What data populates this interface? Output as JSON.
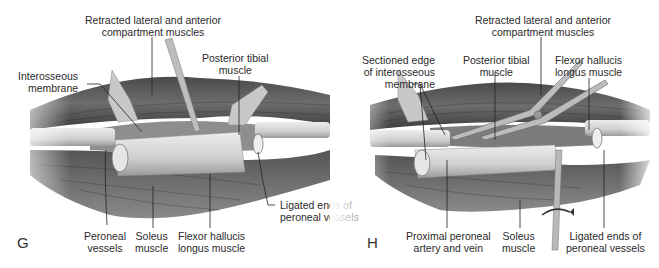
{
  "figure": {
    "panels": [
      {
        "id": "G",
        "letter": "G",
        "labels": {
          "retracted": "Retracted lateral and anterior\ncompartment muscles",
          "interosseous": "Interosseous\nmembrane",
          "posterior_tibial": "Posterior tibial\nmuscle",
          "peroneal_vessels": "Peroneal\nvessels",
          "soleus": "Soleus\nmuscle",
          "fhl": "Flexor hallucis\nlongus muscle",
          "ligated": "Ligated ends of\nperoneal vessels"
        }
      },
      {
        "id": "H",
        "letter": "H",
        "labels": {
          "retracted": "Retracted lateral and anterior\ncompartment muscles",
          "sectioned_edge": "Sectioned edge\nof interosseous\nmembrane",
          "posterior_tibial": "Posterior tibial\nmuscle",
          "fhl": "Flexor hallucis\nlongus muscle",
          "proximal_peroneal": "Proximal peroneal\nartery and vein",
          "soleus": "Soleus\nmuscle",
          "ligated": "Ligated ends of\nperoneal vessels"
        }
      }
    ],
    "colors": {
      "background": "#ffffff",
      "muscle_dark": "#3c3c3c",
      "muscle_mid": "#7a7a7a",
      "bone": "#d8d8d8",
      "text": "#2a2a2a"
    }
  }
}
